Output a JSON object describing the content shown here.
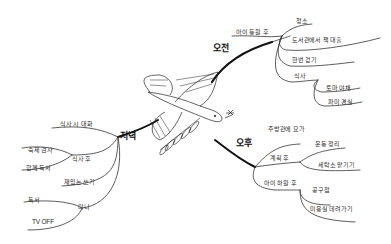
{
  "mindmap": {
    "center": "bird-with-flower-and-leaf-branch",
    "branches": {
      "morning": {
        "label": "오전",
        "children": {
          "kid_school": {
            "label": "아이 등원 후",
            "items": [
              "청소",
              "도서관에서 책 대출",
              "한번 걷기",
              "식사"
            ],
            "sub": [
              "토마 야채",
              "파미 경실"
            ]
          }
        }
      },
      "afternoon": {
        "label": "오후",
        "children": {
          "yoga": "주방관에 요가",
          "plan": {
            "label": "계획 후",
            "items": [
              "운동 정리",
              "세탁소 맡기기"
            ]
          },
          "kid_home": {
            "label": "아이 하원 후",
            "items": [
              "공구점",
              "미용실 데려가기"
            ]
          }
        }
      },
      "evening": {
        "label": "저녁",
        "children": {
          "meal_time": "식사 시 대화",
          "after_meal": {
            "label": "식사 후",
            "items": [
              "숙제 검사",
              "함께 독서"
            ]
          },
          "diary": "재밌는 쓰기",
          "before_bed": {
            "label": "미니",
            "items": [
              "독서",
              "TV OFF"
            ]
          }
        }
      }
    },
    "colors": {
      "ink": "#1a1a1a",
      "background": "#ffffff"
    }
  }
}
